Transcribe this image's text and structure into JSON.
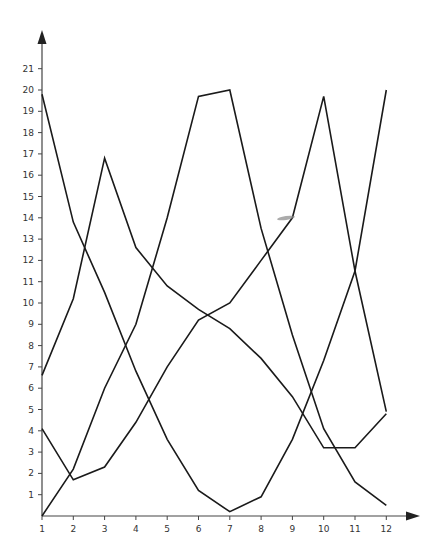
{
  "chart_data": {
    "type": "line",
    "title": "",
    "xlabel": "",
    "ylabel": "",
    "x": [
      1,
      2,
      3,
      4,
      5,
      6,
      7,
      8,
      9,
      10,
      11,
      12
    ],
    "xticks": [
      "1",
      "2",
      "3",
      "4",
      "5",
      "6",
      "7",
      "8",
      "9",
      "10",
      "11",
      "12"
    ],
    "yticks": [
      "1",
      "2",
      "3",
      "4",
      "5",
      "6",
      "7",
      "8",
      "9",
      "10",
      "11",
      "12",
      "13",
      "14",
      "15",
      "16",
      "17",
      "18",
      "19",
      "20",
      "21"
    ],
    "xlim": [
      1,
      13
    ],
    "ylim": [
      0,
      22
    ],
    "grid": false,
    "legend": "none",
    "series": [
      {
        "name": "Series A",
        "values": [
          19.8,
          13.8,
          10.5,
          6.8,
          3.6,
          1.2,
          0.2,
          0.9,
          3.6,
          7.3,
          11.5,
          20.0
        ]
      },
      {
        "name": "Series B",
        "values": [
          6.6,
          10.2,
          16.8,
          12.6,
          10.8,
          9.7,
          8.8,
          7.4,
          5.6,
          3.2,
          3.2,
          4.8
        ]
      },
      {
        "name": "Series C",
        "values": [
          4.1,
          1.7,
          2.3,
          4.4,
          7.0,
          9.2,
          10.0,
          12.0,
          14.0,
          19.7,
          11.5,
          4.9
        ]
      },
      {
        "name": "Series D",
        "values": [
          0.0,
          2.2,
          6.0,
          9.0,
          14.0,
          19.7,
          20.0,
          13.5,
          8.5,
          4.1,
          1.6,
          0.5
        ]
      }
    ],
    "colors": {
      "line": "#1a1a1a",
      "axis": "#444444",
      "smudge": "#888888"
    }
  }
}
